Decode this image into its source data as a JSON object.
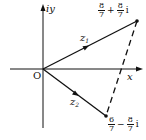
{
  "diagram": {
    "type": "complex-plane",
    "axes": {
      "x_label": "x",
      "y_label": "iy",
      "origin_label": "O"
    },
    "vectors": [
      {
        "name": "z1",
        "label_main": "z",
        "label_sub": "1",
        "from": "O",
        "to": "p1"
      },
      {
        "name": "z2",
        "label_main": "z",
        "label_sub": "2",
        "from": "O",
        "to": "p2"
      }
    ],
    "points": {
      "p1": {
        "re_num": "8",
        "re_den": "7",
        "op": "+",
        "im_num": "8",
        "im_den": "7",
        "unit": "i"
      },
      "p2": {
        "re_num": "6",
        "re_den": "7",
        "op": "−",
        "im_num": "8",
        "im_den": "7",
        "unit": "i"
      }
    },
    "dashed_segment": {
      "from": "p1",
      "to": "p2"
    },
    "colors": {
      "stroke": "#111111",
      "background": "#ffffff"
    }
  }
}
